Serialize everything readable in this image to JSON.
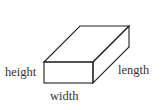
{
  "diagram": {
    "type": "rectangular-prism",
    "stroke_color": "#222222",
    "label_color": "#333333",
    "labels": {
      "height": "height",
      "length": "length",
      "width": "width"
    }
  }
}
